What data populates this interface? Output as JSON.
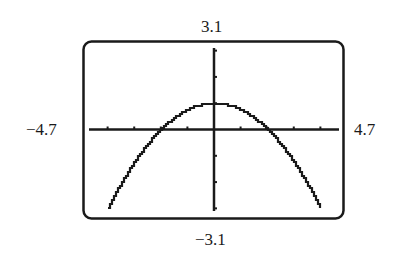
{
  "window": {
    "xmin": "−4.7",
    "xmax": "4.7",
    "ymin": "−3.1",
    "ymax": "3.1"
  },
  "chart_data": {
    "type": "line",
    "title": "",
    "xlabel": "",
    "ylabel": "",
    "xlim": [
      -4.7,
      4.7
    ],
    "ylim": [
      -3.1,
      3.1
    ],
    "grid": false,
    "legend": null,
    "x_ticks": [
      -4,
      -3,
      -2,
      -1,
      1,
      2,
      3,
      4
    ],
    "y_ticks": [
      -3,
      -2,
      -1,
      1,
      2,
      3
    ],
    "window_labels": {
      "left": "−4.7",
      "right": "4.7",
      "top": "3.1",
      "bottom": "−3.1"
    },
    "series": [
      {
        "name": "y = 1 - 0.25x^2",
        "x": [
          -4.0,
          -3.5,
          -3.0,
          -2.5,
          -2.0,
          -1.5,
          -1.0,
          -0.5,
          0.0,
          0.5,
          1.0,
          1.5,
          2.0,
          2.5,
          3.0,
          3.5,
          4.0
        ],
        "y": [
          -3.0,
          -2.06,
          -1.25,
          -0.56,
          0.0,
          0.44,
          0.75,
          0.94,
          1.0,
          0.94,
          0.75,
          0.44,
          0.0,
          -0.56,
          -1.25,
          -2.06,
          -3.0
        ]
      }
    ],
    "annotations": [
      "vertex at (0, 1)",
      "x-intercepts at -2 and 2"
    ]
  },
  "colors": {
    "ink": "#1a1a1a",
    "background": "#ffffff"
  }
}
